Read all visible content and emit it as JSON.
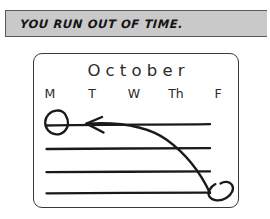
{
  "caption": {
    "text": "YOU RUN OUT OF TIME."
  },
  "calendar": {
    "month": "October",
    "weekdays": [
      "M",
      "T",
      "W",
      "Th",
      "F"
    ],
    "week_rows": 4,
    "annotations": {
      "start_circle_label": "circled-date-last-week-friday",
      "end_circle_label": "circled-date-first-week-monday",
      "arrow_label": "curved-arrow-deadline-moved-earlier",
      "direction": "from bottom-right circled date to top-left circled date"
    }
  },
  "colors": {
    "banner_fill": "#c9c9c9",
    "banner_border": "#5a5a5a",
    "ink": "#1a1a1a",
    "card_border": "#3a3a3a",
    "page_background": "#ffffff",
    "text": "#2b2b2b"
  }
}
